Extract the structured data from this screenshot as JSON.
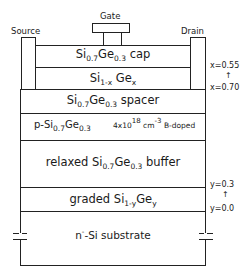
{
  "terminals": {
    "gate": "Gate",
    "source": "Source",
    "drain": "Drain"
  },
  "layers": {
    "cap": {
      "pre": "Si",
      "sub1": "0.7",
      "mid": "Ge",
      "sub2": "0.3",
      "post": " cap"
    },
    "channel": {
      "pre": "Si",
      "sub1": "1-x",
      "mid": " Ge",
      "sub2": "x"
    },
    "spacer": {
      "pre": "Si",
      "sub1": "0.7",
      "mid": "Ge",
      "sub2": "0.3",
      "post": " spacer"
    },
    "doped": {
      "pre": "p-Si",
      "sub1": "0.7",
      "mid": "Ge",
      "sub2": "0.3",
      "conc_base": "4x10",
      "conc_exp": "18",
      "unit": "cm",
      "unit_exp": "-3",
      "dopant": "B-doped"
    },
    "buffer": {
      "pre": "relaxed Si",
      "sub1": "0.7",
      "mid": "Ge",
      "sub2": "0.3",
      "post": " buffer"
    },
    "graded": {
      "pre": "graded Si",
      "sub1": "1-y",
      "mid": "Ge",
      "sub2": "y"
    },
    "substrate": {
      "pre": "n",
      "sup": "-",
      "post": "-Si substrate"
    }
  },
  "annotations": {
    "x_top": "x=0.55",
    "x_arrow": "↑",
    "x_bottom": "x=0.70",
    "y_top": "y=0.3",
    "y_arrow": "↑",
    "y_bottom": "y=0.0"
  }
}
